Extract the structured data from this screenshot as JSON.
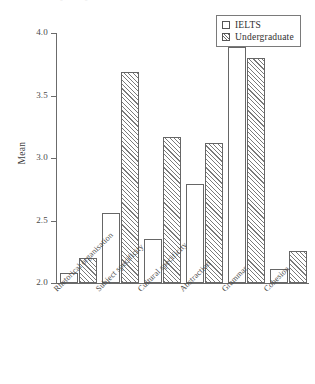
{
  "chart_data": {
    "type": "bar",
    "title": "",
    "subtitle": "",
    "xlabel": "",
    "ylabel": "Mean",
    "ylim": [
      2.0,
      4.0
    ],
    "ytick_labels": [
      "2.0",
      "2.5",
      "3.0",
      "3.5",
      "4.0"
    ],
    "ytick_values": [
      2.0,
      2.5,
      3.0,
      3.5,
      4.0
    ],
    "grid": false,
    "legend_position": "top-right",
    "categories": [
      "Rhetorical organisation",
      "Subject specificity",
      "Cultural specificity",
      "Abstraction",
      "Grammar",
      "Cohesion"
    ],
    "series": [
      {
        "name": "IELTS",
        "fill": "open",
        "values": [
          2.08,
          2.56,
          2.35,
          2.79,
          3.89,
          2.11
        ]
      },
      {
        "name": "Undergraduate",
        "fill": "hatched",
        "values": [
          2.2,
          3.69,
          3.17,
          3.12,
          3.8,
          2.26
        ]
      }
    ]
  },
  "legend": {
    "entries": [
      {
        "label": "IELTS",
        "swatch": "open-square-swatch"
      },
      {
        "label": "Undergraduate",
        "swatch": "hatched-square-swatch"
      }
    ]
  },
  "axes": {
    "y_title": "Mean"
  },
  "colors": {
    "axis": "#6b6b6b",
    "bar_outline": "#666666",
    "bar_ielts_fill": "#ffffff",
    "bar_undergraduate_hatch": "#7a7a7a",
    "text": "#3a3a3a",
    "background": "#ffffff"
  },
  "caption_remnant": "▫                                                          ▫"
}
